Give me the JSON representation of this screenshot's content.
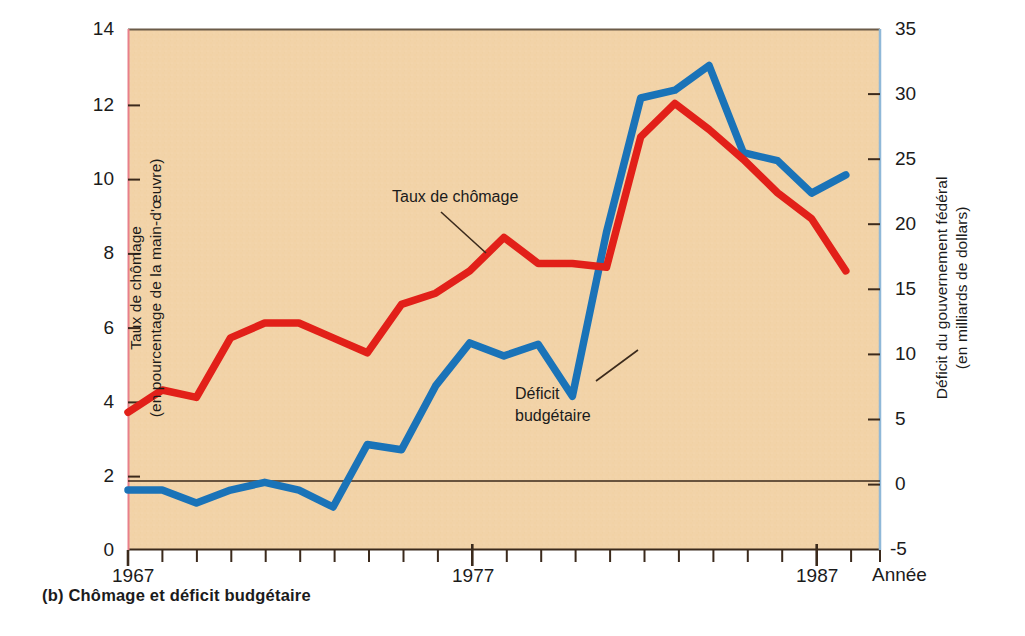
{
  "caption": "(b) Chômage et déficit budgétaire",
  "axes": {
    "left_title_line1": "Taux de chômage",
    "left_title_line2": "(en pourcentage de la main-d'œuvre)",
    "right_title_line1": "Déficit du gouvernement fédéral",
    "right_title_line2": "(en milliards de dollars)",
    "x_title": "Année"
  },
  "colors": {
    "plot_background": "#f2d3a8",
    "unemployment_line": "#e22019",
    "deficit_line": "#1a73b8",
    "left_axis_spine": "#e8808a",
    "right_axis_spine": "#8fb8d8",
    "zero_line": "#3b2a1c",
    "text": "#1b1b1b"
  },
  "chart_data": {
    "type": "line",
    "title": "(b) Chômage et déficit budgétaire",
    "xlabel": "Année",
    "grid": false,
    "legend": "annotations-on-plot",
    "xlim": [
      1967,
      1989
    ],
    "x_tick_labels": [
      "1967",
      "1977",
      "1987"
    ],
    "x_tick_label_years": [
      1967,
      1977,
      1987
    ],
    "x_minor_tick_years": [
      1968,
      1969,
      1970,
      1971,
      1972,
      1973,
      1974,
      1975,
      1976,
      1978,
      1979,
      1980,
      1981,
      1982,
      1983,
      1984,
      1985,
      1986,
      1988,
      1989
    ],
    "left_axis": {
      "label": "Taux de chômage (en pourcentage de la main-d'œuvre)",
      "ylim": [
        0,
        14
      ],
      "ticks": [
        0,
        2,
        4,
        6,
        8,
        10,
        12,
        14
      ],
      "tick_labels": [
        "0",
        "2",
        "4",
        "6",
        "8",
        "10",
        "12",
        "14"
      ]
    },
    "right_axis": {
      "label": "Déficit du gouvernement fédéral (en milliards de dollars)",
      "ylim": [
        -5,
        35
      ],
      "ticks": [
        -5,
        0,
        5,
        10,
        15,
        20,
        25,
        30,
        35
      ],
      "tick_labels": [
        "-5",
        "0",
        "5",
        "10",
        "15",
        "20",
        "25",
        "30",
        "35"
      ]
    },
    "x": [
      1967,
      1968,
      1969,
      1970,
      1971,
      1972,
      1973,
      1974,
      1975,
      1976,
      1977,
      1978,
      1979,
      1980,
      1981,
      1982,
      1983,
      1984,
      1985,
      1986,
      1987,
      1988
    ],
    "series": [
      {
        "name": "Taux de chômage",
        "axis": "left",
        "color": "#e22019",
        "values": [
          3.7,
          4.3,
          4.1,
          5.7,
          6.1,
          6.1,
          5.7,
          5.3,
          6.6,
          6.9,
          7.5,
          8.4,
          7.7,
          7.7,
          7.6,
          11.1,
          12.0,
          11.3,
          10.5,
          9.6,
          8.9,
          7.5
        ]
      },
      {
        "name": "Déficit budgétaire",
        "axis": "right",
        "color": "#1a73b8",
        "values": [
          -0.4,
          -0.4,
          -1.4,
          -0.4,
          0.2,
          -0.4,
          -1.7,
          3.1,
          2.7,
          7.6,
          10.9,
          9.9,
          10.8,
          6.8,
          19.4,
          29.7,
          30.3,
          32.2,
          25.5,
          24.9,
          22.4,
          23.8
        ]
      }
    ],
    "annotations": [
      {
        "text": "Taux de chômage",
        "series": "Taux de chômage"
      },
      {
        "text": "Déficit budgétaire",
        "series": "Déficit budgétaire"
      }
    ]
  }
}
